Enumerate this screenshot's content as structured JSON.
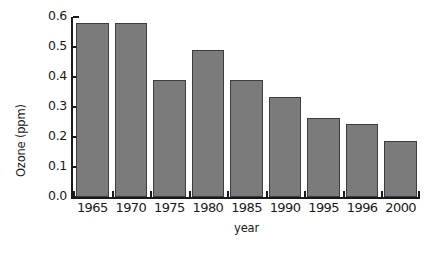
{
  "chart_data": {
    "type": "bar",
    "title": "",
    "subtitle": "",
    "xlabel": "year",
    "ylabel": "Ozone (ppm)",
    "categories": [
      "1965",
      "1970",
      "1975",
      "1980",
      "1985",
      "1990",
      "1995",
      "1996",
      "2000"
    ],
    "values": [
      0.58,
      0.58,
      0.39,
      0.49,
      0.39,
      0.335,
      0.263,
      0.243,
      0.187
    ],
    "ylim": [
      0.0,
      0.6
    ],
    "yticks": [
      "0.0",
      "0.1",
      "0.2",
      "0.3",
      "0.4",
      "0.5",
      "0.6"
    ],
    "ytick_values": [
      0.0,
      0.1,
      0.2,
      0.3,
      0.4,
      0.5,
      0.6
    ],
    "grid": false,
    "legend": false,
    "legend_position": "none",
    "bar_color": "#7b7b7b",
    "bar_edge_color": "#3d3d3d",
    "axis_color": "#1a1a1a",
    "background": "#ffffff"
  }
}
